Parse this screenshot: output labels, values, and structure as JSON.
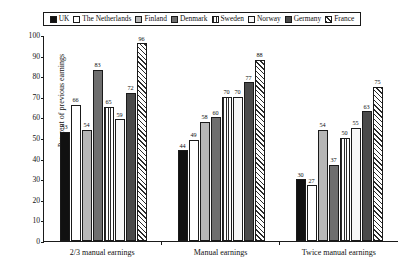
{
  "legend": {
    "position": "top",
    "entries": [
      {
        "label": "UK",
        "fill": "solid-black"
      },
      {
        "label": "The Netherlands",
        "fill": "white"
      },
      {
        "label": "Finland",
        "fill": "light-gray"
      },
      {
        "label": "Denmark",
        "fill": "dark-gray"
      },
      {
        "label": "Sweden",
        "fill": "vertical-stripes"
      },
      {
        "label": "Norway",
        "fill": "near-white"
      },
      {
        "label": "Germany",
        "fill": "charcoal"
      },
      {
        "label": "France",
        "fill": "diagonal-hatch"
      }
    ]
  },
  "axes": {
    "ylabel": "Per cent of previous earnings",
    "xlabel": "",
    "yticks": [
      0,
      10,
      20,
      30,
      40,
      50,
      60,
      70,
      80,
      90,
      100
    ]
  },
  "chart_data": {
    "type": "bar",
    "title": "",
    "subtitle": "",
    "xlabel": "",
    "ylabel": "Per cent of previous earnings",
    "ylim": [
      0,
      100
    ],
    "ytick_step": 10,
    "grid": false,
    "legend_position": "top",
    "value_labels": true,
    "categories": [
      "2/3 manual earnings",
      "Manual earnings",
      "Twice manual earnings"
    ],
    "series": [
      {
        "name": "UK",
        "fill": "solid-black",
        "values": [
          53,
          44,
          30
        ]
      },
      {
        "name": "The Netherlands",
        "fill": "white",
        "values": [
          66,
          49,
          27
        ]
      },
      {
        "name": "Finland",
        "fill": "light-gray",
        "values": [
          54,
          58,
          54
        ]
      },
      {
        "name": "Denmark",
        "fill": "dark-gray",
        "values": [
          83,
          60,
          37
        ]
      },
      {
        "name": "Sweden",
        "fill": "vertical-stripes",
        "values": [
          65,
          70,
          50
        ]
      },
      {
        "name": "Norway",
        "fill": "near-white",
        "values": [
          59,
          70,
          55
        ]
      },
      {
        "name": "Germany",
        "fill": "charcoal",
        "values": [
          72,
          77,
          63
        ]
      },
      {
        "name": "France",
        "fill": "diagonal-hatch",
        "values": [
          96,
          88,
          75
        ]
      }
    ]
  }
}
